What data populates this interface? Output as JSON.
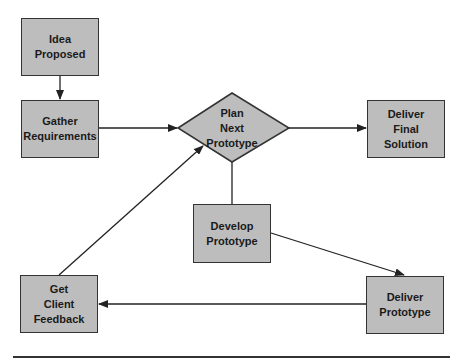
{
  "diagram": {
    "type": "flowchart",
    "nodes": [
      {
        "id": "idea",
        "label": "Idea\nProposed",
        "shape": "rect"
      },
      {
        "id": "gather",
        "label": "Gather\nRequirements",
        "shape": "rect"
      },
      {
        "id": "plan",
        "label": "Plan\nNext\nPrototype",
        "shape": "diamond"
      },
      {
        "id": "final",
        "label": "Deliver\nFinal\nSolution",
        "shape": "rect"
      },
      {
        "id": "develop",
        "label": "Develop\nPrototype",
        "shape": "rect"
      },
      {
        "id": "deliver",
        "label": "Deliver\nPrototype",
        "shape": "rect"
      },
      {
        "id": "feedback",
        "label": "Get\nClient\nFeedback",
        "shape": "rect"
      }
    ],
    "edges": [
      {
        "from": "idea",
        "to": "gather",
        "arrow": true
      },
      {
        "from": "gather",
        "to": "plan",
        "arrow": true
      },
      {
        "from": "plan",
        "to": "final",
        "arrow": true
      },
      {
        "from": "plan",
        "to": "develop",
        "arrow": false
      },
      {
        "from": "develop",
        "to": "deliver",
        "arrow": true
      },
      {
        "from": "deliver",
        "to": "feedback",
        "arrow": true
      },
      {
        "from": "feedback",
        "to": "plan",
        "arrow": true
      }
    ],
    "colors": {
      "fill": "#bdbdbd",
      "stroke": "#333333",
      "text": "#1a1a1a"
    }
  }
}
